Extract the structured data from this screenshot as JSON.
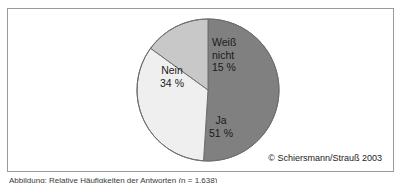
{
  "figure": {
    "credit": "© Schiersmann/Strauß 2003",
    "caption": "Abbildung: Relative Häufigkeiten der Antworten (n = 1.638)"
  },
  "chart_data": {
    "type": "pie",
    "title": "",
    "subtitle": "",
    "xlabel": "",
    "ylabel": "",
    "grid": false,
    "legend": "none",
    "labels_inside_slices": true,
    "start_angle_deg": 0,
    "direction": "clockwise",
    "categories": [
      "Ja",
      "Nein",
      "Weiß nicht"
    ],
    "values": [
      51,
      34,
      15
    ],
    "unit": "%",
    "value_labels": [
      "51 %",
      "34 %",
      "15 %"
    ],
    "colors": [
      "#808080",
      "#efefef",
      "#c8c8c8"
    ],
    "slices": [
      {
        "name": "Ja",
        "value": 51,
        "value_label": "51 %",
        "color": "#808080",
        "start_deg": 0,
        "sweep_deg": 183.6
      },
      {
        "name": "Nein",
        "value": 34,
        "value_label": "34 %",
        "color": "#efefef",
        "start_deg": 183.6,
        "sweep_deg": 122.4
      },
      {
        "name": "Weiß nicht",
        "value": 15,
        "value_label": "15 %",
        "color": "#c8c8c8",
        "start_deg": 306.0,
        "sweep_deg": 54.0
      }
    ],
    "annotations": [
      "© Schiersmann/Strauß 2003"
    ]
  },
  "labels": {
    "weiss_nicht": {
      "line1": "Weiß",
      "line2": "nicht",
      "value": "15 %"
    },
    "nein": {
      "name": "Nein",
      "value": "34 %"
    },
    "ja": {
      "name": "Ja",
      "value": "51 %"
    }
  },
  "style": {
    "frame_border_color": "#9a9a9a",
    "pie_outline_color": "#6e6e6e",
    "background": "#ffffff",
    "text_color": "#1a1a1a"
  }
}
